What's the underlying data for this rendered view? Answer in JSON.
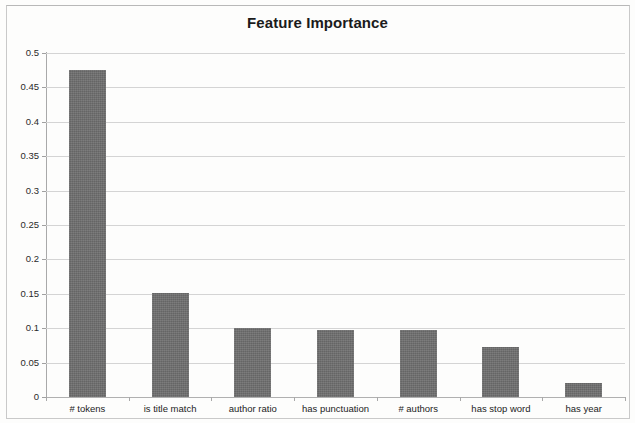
{
  "chart_data": {
    "type": "bar",
    "title": "Feature Importance",
    "xlabel": "",
    "ylabel": "",
    "categories": [
      "# tokens",
      "is title match",
      "author ratio",
      "has punctuation",
      "# authors",
      "has stop word",
      "has year"
    ],
    "values": [
      0.475,
      0.151,
      0.101,
      0.098,
      0.097,
      0.072,
      0.021
    ],
    "ylim": [
      0,
      0.5
    ],
    "ytick_step": 0.05,
    "ytick_labels": [
      "0",
      "0.05",
      "0.1",
      "0.15",
      "0.2",
      "0.25",
      "0.3",
      "0.35",
      "0.4",
      "0.45",
      "0.5"
    ],
    "ytick_values": [
      0,
      0.05,
      0.1,
      0.15,
      0.2,
      0.25,
      0.3,
      0.35,
      0.4,
      0.45,
      0.5
    ],
    "grid": true,
    "grid_axis": "y",
    "legend": false,
    "legend_position": "none",
    "bar_color": "#6f6f6f",
    "gridline_color": "#d4d4d4",
    "axis_color": "#a9a9a9",
    "title_color": "#1b1b1b",
    "background_color": "#ffffff"
  }
}
